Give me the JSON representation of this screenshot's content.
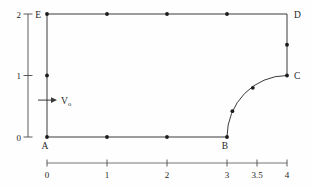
{
  "diagram": {
    "title": "",
    "line_color": "#3a3a3a",
    "axis_color": "#4a4a4a",
    "dot_color": "#1c1c1c",
    "text_color": "#1f1f1f",
    "axes": {
      "y": {
        "ticks": [
          {
            "label": "0",
            "value": 0
          },
          {
            "label": "1",
            "value": 1
          },
          {
            "label": "2",
            "value": 2
          }
        ],
        "range": [
          0,
          2
        ]
      },
      "x": {
        "ticks": [
          {
            "label": "0",
            "value": 0
          },
          {
            "label": "1",
            "value": 1
          },
          {
            "label": "2",
            "value": 2
          },
          {
            "label": "3",
            "value": 3
          },
          {
            "label": "3.5",
            "value": 3.5
          },
          {
            "label": "4",
            "value": 4
          }
        ],
        "range": [
          0,
          4
        ]
      }
    },
    "domain_outline": {
      "vertices": {
        "A": [
          0,
          0
        ],
        "B": [
          3,
          0
        ],
        "C": [
          4,
          1
        ],
        "D": [
          4,
          2
        ],
        "E": [
          0,
          2
        ]
      },
      "fillet": {
        "center": [
          4,
          0
        ],
        "radius": 1,
        "from": "B",
        "to": "C"
      }
    },
    "corner_labels": [
      {
        "label": "A",
        "x": 0,
        "y": 0,
        "placement": "below"
      },
      {
        "label": "B",
        "x": 3,
        "y": 0,
        "placement": "below"
      },
      {
        "label": "C",
        "x": 4,
        "y": 1,
        "placement": "right"
      },
      {
        "label": "D",
        "x": 4,
        "y": 2,
        "placement": "right"
      },
      {
        "label": "E",
        "x": 0,
        "y": 2,
        "placement": "left"
      }
    ],
    "boundary_dots": [
      [
        0,
        0
      ],
      [
        1,
        0
      ],
      [
        2,
        0
      ],
      [
        3,
        0
      ],
      [
        3.09,
        0.42
      ],
      [
        3.43,
        0.8
      ],
      [
        4,
        1
      ],
      [
        4,
        1.5
      ],
      [
        3,
        2
      ],
      [
        2,
        2
      ],
      [
        1,
        2
      ],
      [
        0,
        2
      ],
      [
        0,
        1
      ]
    ],
    "inlet_arrow": {
      "label": "V",
      "subscript": "o",
      "y": 0.6
    }
  }
}
